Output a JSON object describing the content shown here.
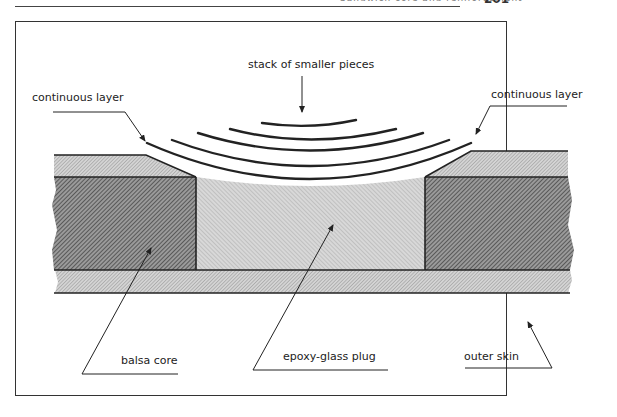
{
  "page": {
    "header_text": "Sandwich core and reinforcement",
    "page_number": "201"
  },
  "diagram": {
    "labels": {
      "stack": "stack of smaller pieces",
      "continuous_left": "continuous layer",
      "continuous_right": "continuous layer",
      "balsa_core": "balsa core",
      "plug": "epoxy-glass plug",
      "outer_skin": "outer skin"
    },
    "colors": {
      "line": "#222222",
      "core_hatch": "#555555",
      "plug_fill": "#c8c8c8",
      "skin_fill": "#bdbdbd"
    }
  }
}
